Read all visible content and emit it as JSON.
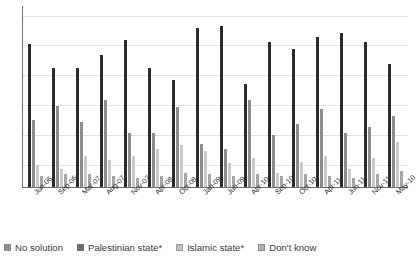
{
  "chart_data": {
    "type": "bar",
    "title": "",
    "xlabel": "",
    "ylabel": "",
    "ylim": [
      0,
      100
    ],
    "grid": true,
    "legend_position": "bottom",
    "categories": [
      "Jun-06",
      "Sep-06",
      "Mar-07",
      "Aug-07",
      "Nov-07",
      "Apr-08",
      "Oct-08",
      "Jan-09",
      "Jun-09",
      "Apr-10",
      "Sep-10",
      "Oct-10",
      "Apr-11",
      "Jun-11",
      "Nov-11",
      "May-10"
    ],
    "series": [
      {
        "name": "No solution",
        "color": "#2b2b2b",
        "values": [
          79,
          66,
          66,
          73,
          81,
          66,
          59,
          88,
          89,
          57,
          80,
          76,
          83,
          85,
          80,
          68
        ]
      },
      {
        "name": "Palestinian state*",
        "color": "#8d8d8d",
        "values": [
          37,
          45,
          36,
          48,
          30,
          30,
          44,
          24,
          21,
          48,
          29,
          35,
          43,
          30,
          33,
          39
        ]
      },
      {
        "name": "Islamic state*",
        "color": "#c9c9c9",
        "values": [
          12,
          10,
          17,
          15,
          17,
          21,
          23,
          20,
          13,
          16,
          8,
          14,
          17,
          10,
          16,
          25
        ]
      },
      {
        "name": "Don't know",
        "color": "#a6a6a6",
        "values": [
          6,
          7,
          7,
          6,
          5,
          6,
          8,
          7,
          6,
          7,
          6,
          7,
          6,
          5,
          7,
          9
        ]
      }
    ]
  },
  "legend": {
    "items": [
      {
        "label": "No solution"
      },
      {
        "label": "Palestinian state*"
      },
      {
        "label": "Islamic state*"
      },
      {
        "label": "Don't know"
      }
    ]
  }
}
